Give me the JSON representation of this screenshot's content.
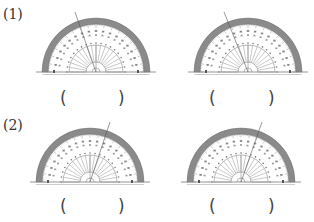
{
  "problems": [
    {
      "label": "(1)",
      "protractors": [
        {
          "cx": 96,
          "cy": 72,
          "r": 54,
          "line_end": [
            75,
            12
          ],
          "answer_open": "(",
          "answer_close": ")"
        },
        {
          "cx": 248,
          "cy": 72,
          "r": 54,
          "line_end": [
            224,
            12
          ],
          "answer_open": "(",
          "answer_close": ")"
        }
      ]
    },
    {
      "label": "(2)",
      "protractors": [
        {
          "cx": 90,
          "cy": 182,
          "r": 54,
          "line_end": [
            110,
            122
          ],
          "answer_open": "(",
          "answer_close": ")"
        },
        {
          "cx": 241,
          "cy": 182,
          "r": 54,
          "line_end": [
            262,
            122
          ],
          "answer_open": "(",
          "answer_close": ")"
        }
      ]
    }
  ],
  "colors": {
    "band": "#8a8a8a",
    "tick": "#666666",
    "line": "#555555"
  }
}
